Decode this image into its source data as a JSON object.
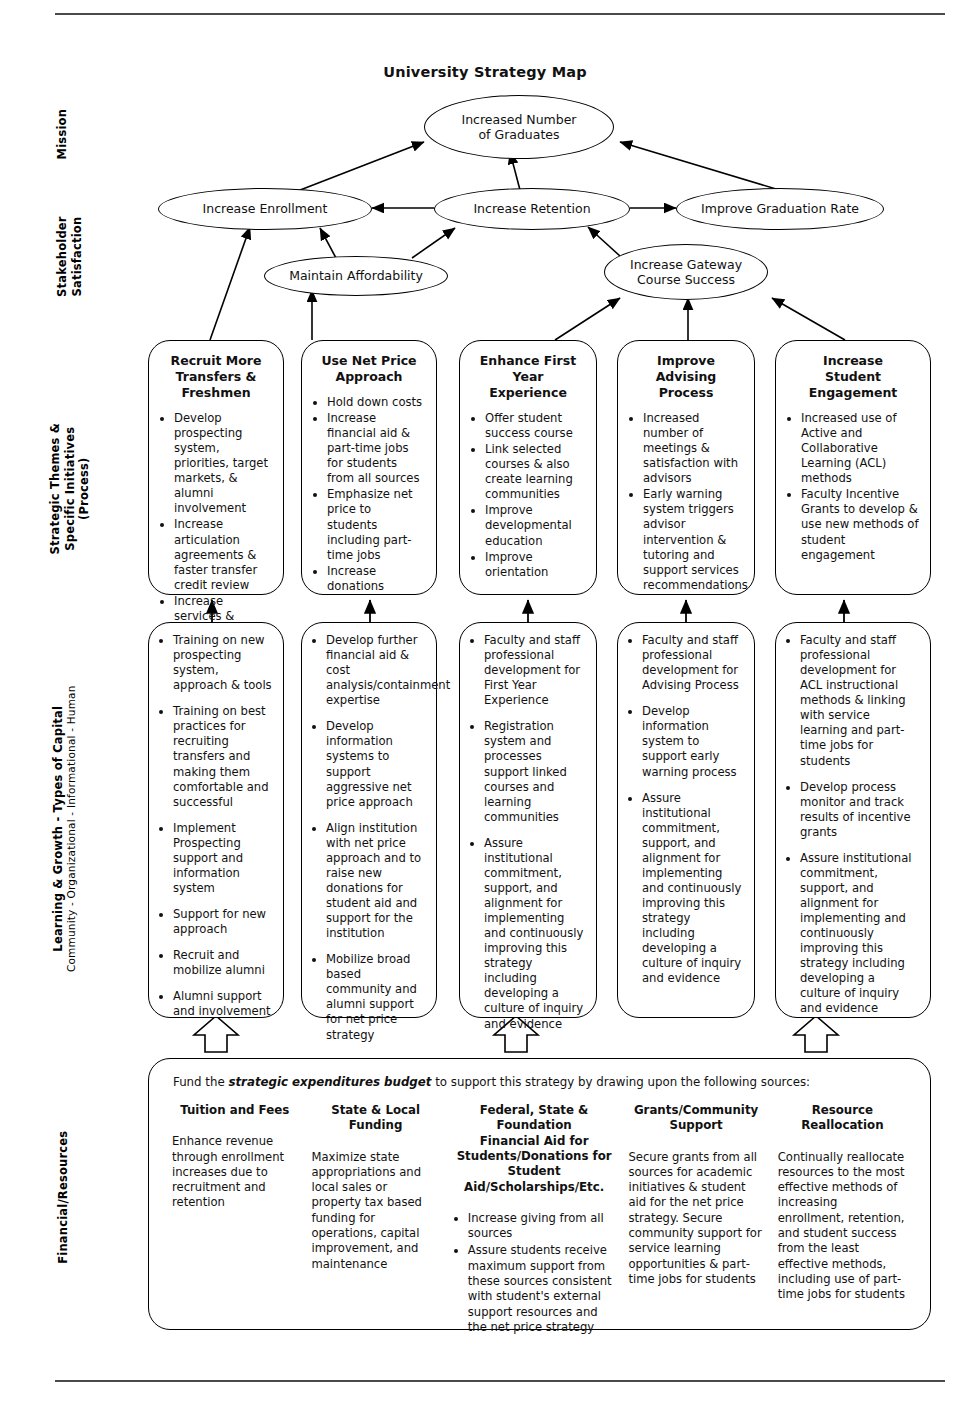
{
  "title": "University Strategy Map",
  "row_labels": [
    {
      "id": "mission",
      "text": "Mission",
      "sub": ""
    },
    {
      "id": "stakeholder",
      "text": "Stakeholder\nSatisfaction",
      "sub": ""
    },
    {
      "id": "strategic-themes",
      "text": "Strategic Themes &\nSpecific Initiatives\n(Process)",
      "sub": ""
    },
    {
      "id": "learning-growth",
      "text": "Learning & Growth - Types of Capital",
      "sub": "Community - Organizational - Informational - Human"
    },
    {
      "id": "financial",
      "text": "Financial/Resources",
      "sub": ""
    }
  ],
  "nodes": {
    "mission": "Increased Number\nof Graduates",
    "enrollment": "Increase  Enrollment",
    "retention": "Increase Retention",
    "graduation": "Improve Graduation Rate",
    "affordability": "Maintain Affordability",
    "gateway": "Increase Gateway\nCourse Success"
  },
  "themes": [
    {
      "title": "Recruit More\nTransfers &\nFreshmen",
      "items": [
        "Develop prospecting system, priorities, target markets, & alumni involvement",
        "Increase articulation agreements & faster transfer credit review",
        "Increase services & facilities for transfers"
      ]
    },
    {
      "title": "Use Net Price\nApproach",
      "items": [
        "Hold down costs",
        "Increase financial aid & part-time jobs for students  from all sources",
        "Emphasize net price to students including part-time jobs",
        "Increase donations"
      ]
    },
    {
      "title": "Enhance First\nYear\nExperience",
      "items": [
        "Offer student success course",
        "Link selected courses & also create learning communities",
        "Improve developmental education",
        "Improve orientation"
      ]
    },
    {
      "title": "Improve\nAdvising\nProcess",
      "items": [
        "Increased number of meetings & satisfaction with advisors",
        "Early warning system triggers advisor intervention & tutoring and support services recommendations"
      ]
    },
    {
      "title": "Increase\nStudent\nEngagement",
      "items": [
        "Increased use of Active and Collaborative Learning (ACL) methods",
        "Faculty Incentive Grants to develop & use new methods of student engagement"
      ]
    }
  ],
  "capital": [
    {
      "items": [
        "Training on new prospecting system, approach & tools",
        "Training on best practices for recruiting transfers and making them comfortable and successful",
        "Implement Prospecting support and information system",
        "Support for new approach",
        "Recruit and mobilize alumni",
        "Alumni support and involvement"
      ]
    },
    {
      "items": [
        "Develop further financial aid & cost analysis/containment expertise",
        "Develop information systems to support aggressive net price approach",
        "Align institution with net price approach and to raise new donations for student aid and support for the institution",
        "Mobilize broad based community and alumni support for net price strategy"
      ]
    },
    {
      "items": [
        "Faculty and staff professional development for First Year Experience",
        "Registration system and processes support linked courses and learning communities",
        "Assure institutional commitment, support, and alignment for implementing and continuously improving this strategy including developing a culture of inquiry and evidence"
      ]
    },
    {
      "items": [
        "Faculty and staff professional development for Advising Process",
        "Develop information system to support early warning process",
        "Assure institutional commitment, support, and alignment for implementing and continuously improving this strategy including developing a culture of inquiry and evidence"
      ]
    },
    {
      "items": [
        "Faculty and staff professional development for ACL instructional methods & linking with service learning and part-time jobs for students",
        "Develop process monitor and track results of incentive grants",
        "Assure institutional commitment, support, and alignment for implementing and continuously improving this strategy including developing a culture of inquiry and evidence"
      ]
    }
  ],
  "finance": {
    "intro_before": "Fund the ",
    "intro_emphasis": "strategic expenditures budget",
    "intro_after": " to support this strategy by drawing upon the following sources:",
    "columns": [
      {
        "header": "Tuition and Fees",
        "body": "Enhance revenue through enrollment increases due to recruitment and retention",
        "bullets": []
      },
      {
        "header": "State & Local\nFunding",
        "body": "Maximize state appropriations and local sales or property tax based funding for operations, capital improvement, and maintenance",
        "bullets": []
      },
      {
        "header": "Federal, State & Foundation\nFinancial Aid for\nStudents/Donations for\nStudent Aid/Scholarships/Etc.",
        "body": "",
        "bullets": [
          "Increase giving from all sources",
          "Assure students receive maximum support from these sources consistent with student's external support resources and the net price strategy"
        ]
      },
      {
        "header": "Grants/Community\nSupport",
        "body": "Secure grants from all sources for academic initiatives & student aid for the net price strategy. Secure community support for service learning opportunities & part-time jobs for students",
        "bullets": []
      },
      {
        "header": "Resource Reallocation",
        "body": "Continually reallocate resources to the most effective methods of increasing enrollment, retention, and student success from the least effective methods, including use of part-time jobs for students",
        "bullets": []
      }
    ]
  },
  "colors": {
    "line": "#000000",
    "rule": "#4a4a4a",
    "background": "#ffffff"
  }
}
